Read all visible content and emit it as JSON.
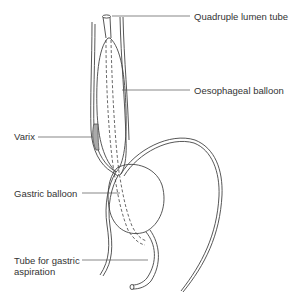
{
  "diagram": {
    "labels": {
      "tube": "Quadruple lumen tube",
      "oesophageal_balloon": "Oesophageal balloon",
      "varix": "Varix",
      "gastric_balloon": "Gastric balloon",
      "aspiration_line1": "Tube for gastric",
      "aspiration_line2": "aspiration"
    },
    "colors": {
      "line": "#444444",
      "text": "#333333",
      "varix_fill": "#aaaaaa",
      "background": "#ffffff"
    }
  }
}
